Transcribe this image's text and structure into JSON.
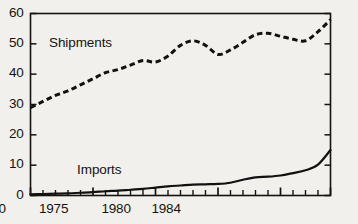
{
  "chart_data": {
    "type": "line",
    "title": "",
    "subtitle": "",
    "xlabel": "",
    "ylabel": "",
    "xlim": [
      1960,
      1984
    ],
    "ylim": [
      0,
      60
    ],
    "yticks": [
      0,
      10,
      20,
      30,
      40,
      50,
      60
    ],
    "ytick_labels": [
      "0",
      "10",
      "20",
      "30",
      "40",
      "50",
      "60"
    ],
    "xticks": [
      1960,
      1965,
      1970,
      1975,
      1980,
      1984
    ],
    "xtick_labels": [
      "1960",
      "1965",
      "1970",
      "1975",
      "1980",
      "1984"
    ],
    "xminor_step": 1,
    "grid": false,
    "legend_position": "inline-annotations",
    "frame": "box",
    "tick_direction": "in",
    "x": [
      1960,
      1961,
      1962,
      1963,
      1964,
      1965,
      1966,
      1967,
      1968,
      1969,
      1970,
      1971,
      1972,
      1973,
      1974,
      1975,
      1976,
      1977,
      1978,
      1979,
      1980,
      1981,
      1982,
      1983,
      1984
    ],
    "series": [
      {
        "name": "Shipments",
        "style": "dashed",
        "color": "#111111",
        "values": [
          29.0,
          31.0,
          33.0,
          34.5,
          36.5,
          38.5,
          40.5,
          41.5,
          43.0,
          44.5,
          44.0,
          46.0,
          49.5,
          51.0,
          49.5,
          46.5,
          48.0,
          50.5,
          53.0,
          53.5,
          52.5,
          51.5,
          51.0,
          54.0,
          58.0
        ]
      },
      {
        "name": "Imports",
        "style": "solid",
        "color": "#111111",
        "values": [
          0.4,
          0.5,
          0.6,
          0.7,
          0.9,
          1.1,
          1.4,
          1.6,
          1.9,
          2.2,
          2.6,
          3.0,
          3.3,
          3.6,
          3.7,
          3.8,
          4.2,
          5.2,
          6.0,
          6.2,
          6.6,
          7.4,
          8.3,
          10.2,
          15.0
        ]
      }
    ],
    "annotations": [
      {
        "text": "Shipments",
        "x": 1964.0,
        "y": 50.0
      },
      {
        "text": "Imports",
        "x": 1965.5,
        "y": 8.0
      }
    ]
  },
  "axis_labels": {
    "y": [
      "60",
      "50",
      "40",
      "30",
      "20",
      "10",
      "0"
    ],
    "x": [
      "1960",
      "1965",
      "1970",
      "1975",
      "1980",
      "1984"
    ]
  },
  "colors": {
    "background": "#f2f0ec",
    "ink": "#15130f",
    "line": "#111111"
  }
}
